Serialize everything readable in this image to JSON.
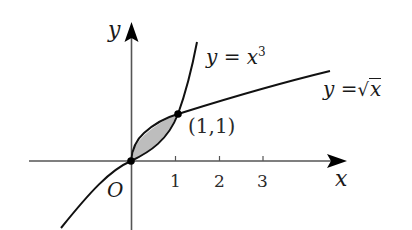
{
  "diagram": {
    "colors": {
      "axis": "#555555",
      "curve": "#111111",
      "shaded_region": "#bdbdbd",
      "point": "#000000",
      "background": "#ffffff"
    },
    "axes": {
      "x_label": "x",
      "y_label": "y",
      "origin_label": "O",
      "x_ticks": [
        "1",
        "2",
        "3"
      ]
    },
    "curves": [
      {
        "name": "cubic",
        "label_lhs": "y = x",
        "label_exponent": "3"
      },
      {
        "name": "square-root",
        "label_lhs": "y =",
        "label_radical": "√",
        "label_radicand": "x"
      }
    ],
    "points": [
      {
        "name": "origin",
        "coords": [
          0,
          0
        ]
      },
      {
        "name": "intersection",
        "coords": [
          1,
          1
        ],
        "label": "(1,1)"
      }
    ],
    "shaded_region": {
      "between": [
        "y = √x",
        "y = x³"
      ],
      "x_range": [
        0,
        1
      ]
    }
  }
}
